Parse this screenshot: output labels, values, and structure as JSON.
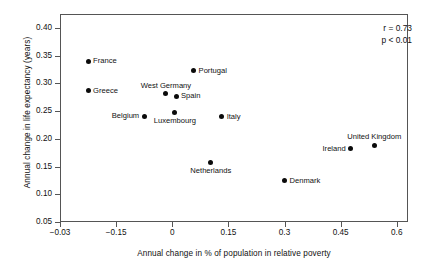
{
  "chart_data": {
    "type": "scatter",
    "title": "",
    "xlabel": "Annual change in % of population in relative poverty",
    "ylabel": "Annual change in life expectancy (years)",
    "xlim": [
      -0.3,
      0.63
    ],
    "ylim": [
      0.05,
      0.425
    ],
    "grid": false,
    "legend": "none",
    "xticks": [
      -0.03,
      -0.15,
      0,
      0.15,
      0.3,
      0.45,
      0.6
    ],
    "xtick_labels": [
      "−0.03",
      "−0.15",
      "0",
      "0.15",
      "0.3",
      "0.45",
      "0.6"
    ],
    "xtick_positions": [
      -0.3,
      -0.15,
      0,
      0.15,
      0.3,
      0.45,
      0.6
    ],
    "yticks": [
      0.05,
      0.1,
      0.15,
      0.2,
      0.25,
      0.3,
      0.35,
      0.4
    ],
    "ytick_labels": [
      "0.05",
      "0.10",
      "0.15",
      "0.20",
      "0.25",
      "0.30",
      "0.35",
      "0.40"
    ],
    "points": [
      {
        "label": "France",
        "x": -0.225,
        "y": 0.34,
        "label_pos": "right"
      },
      {
        "label": "Greece",
        "x": -0.225,
        "y": 0.287,
        "label_pos": "right"
      },
      {
        "label": "Belgium",
        "x": -0.075,
        "y": 0.241,
        "label_pos": "left"
      },
      {
        "label": "West Germany",
        "x": -0.017,
        "y": 0.281,
        "label_pos": "above"
      },
      {
        "label": "Spain",
        "x": 0.01,
        "y": 0.277,
        "label_pos": "right"
      },
      {
        "label": "Luxembourg",
        "x": 0.007,
        "y": 0.248,
        "label_pos": "below"
      },
      {
        "label": "Portugal",
        "x": 0.057,
        "y": 0.323,
        "label_pos": "right"
      },
      {
        "label": "Italy",
        "x": 0.132,
        "y": 0.24,
        "label_pos": "right"
      },
      {
        "label": "Netherlands",
        "x": 0.103,
        "y": 0.158,
        "label_pos": "below"
      },
      {
        "label": "Denmark",
        "x": 0.3,
        "y": 0.124,
        "label_pos": "right"
      },
      {
        "label": "Ireland",
        "x": 0.477,
        "y": 0.182,
        "label_pos": "left"
      },
      {
        "label": "United Kingdom",
        "x": 0.54,
        "y": 0.188,
        "label_pos": "above"
      }
    ],
    "annotations": [
      {
        "text": "r = 0.73"
      },
      {
        "text": "p < 0.01"
      }
    ]
  },
  "colors": {
    "marker": "#0b0b0b",
    "frame": "#555555",
    "text": "#111111",
    "background": "#ffffff"
  }
}
